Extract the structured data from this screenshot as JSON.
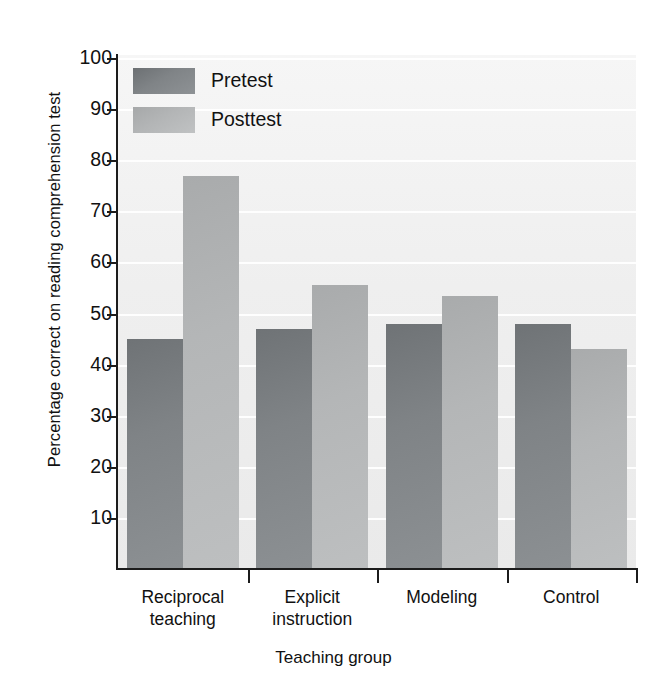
{
  "chart_data": {
    "type": "bar",
    "title": "",
    "subtitle": "",
    "xlabel": "Teaching group",
    "ylabel": "Percentage correct on reading comprehension test",
    "categories": [
      "Reciprocal teaching",
      "Explicit instruction",
      "Modeling",
      "Control"
    ],
    "category_lines": [
      [
        "Reciprocal",
        "teaching"
      ],
      [
        "Explicit",
        "instruction"
      ],
      [
        "Modeling"
      ],
      [
        "Control"
      ]
    ],
    "series": [
      {
        "name": "Pretest",
        "values": [
          45,
          47,
          48,
          48
        ],
        "color": "#7f8386"
      },
      {
        "name": "Posttest",
        "values": [
          77,
          55.5,
          53.5,
          43
        ],
        "color": "#b4b6b7"
      }
    ],
    "ylim": [
      0,
      100
    ],
    "yticks": [
      10,
      20,
      30,
      40,
      50,
      60,
      70,
      80,
      90,
      100
    ],
    "ytick_labels": [
      "10",
      "20",
      "30",
      "40",
      "50",
      "60",
      "70",
      "80",
      "90",
      "100"
    ],
    "grid": true,
    "grid_axis": "y",
    "legend_position": "top-left",
    "plot_background": "#f1f1f1",
    "axis_color": "#1c1c1c"
  },
  "legend": {
    "entries": [
      {
        "label": "Pretest"
      },
      {
        "label": "Posttest"
      }
    ]
  },
  "axes": {
    "y_title": "Percentage correct on reading comprehension test",
    "x_title": "Teaching group"
  }
}
